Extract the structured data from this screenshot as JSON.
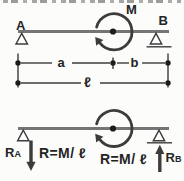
{
  "beam_labels": {
    "left_support": "A",
    "right_support": "B",
    "moment": "M"
  },
  "dimension_labels": {
    "span_a": "a",
    "span_b": "b",
    "total_length": "ℓ"
  },
  "reaction_labels": {
    "left_symbol_main": "R",
    "left_symbol_sub": "A",
    "left_equation": "R=M/ ℓ",
    "right_equation": "R=M/ ℓ",
    "right_symbol_main": "R",
    "right_symbol_sub": "B"
  },
  "colors": {
    "line": "#3c3c3c",
    "beam": "#757575",
    "text": "#242424",
    "bg": "#fcfcfa",
    "strip": "#979797"
  }
}
